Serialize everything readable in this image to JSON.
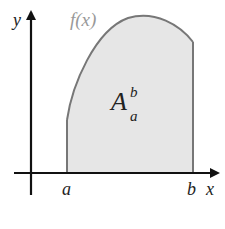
{
  "diagram": {
    "labels": {
      "y_axis": "y",
      "x_axis": "x",
      "function": "f(x)",
      "area_main": "A",
      "area_sup": "b",
      "area_sub": "a",
      "lower_bound": "a",
      "upper_bound": "b"
    },
    "colors": {
      "axis": "#111111",
      "curve": "#777777",
      "fill": "#e6e6e6",
      "label": "#222222",
      "function_label": "#999999"
    }
  }
}
